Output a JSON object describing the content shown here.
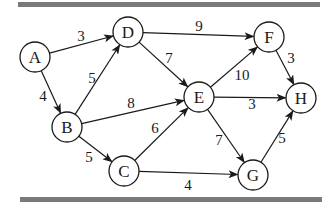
{
  "diagram": {
    "type": "weighted-directed-graph",
    "colors": {
      "bar": "#7a7a7a",
      "stroke": "#1a1a1a",
      "background": "#ffffff"
    },
    "bars": [
      {
        "name": "top-rule",
        "x": 18,
        "y": 2,
        "w": 302,
        "h": 5
      },
      {
        "name": "bottom-rule",
        "x": 20,
        "y": 197,
        "w": 302,
        "h": 5
      }
    ],
    "node_radius": 15,
    "nodes": [
      {
        "id": "A",
        "label": "A",
        "x": 35,
        "y": 57
      },
      {
        "id": "B",
        "label": "B",
        "x": 67,
        "y": 127
      },
      {
        "id": "C",
        "label": "C",
        "x": 124,
        "y": 171
      },
      {
        "id": "D",
        "label": "D",
        "x": 128,
        "y": 32
      },
      {
        "id": "E",
        "label": "E",
        "x": 199,
        "y": 97
      },
      {
        "id": "F",
        "label": "F",
        "x": 269,
        "y": 37
      },
      {
        "id": "G",
        "label": "G",
        "x": 253,
        "y": 175
      },
      {
        "id": "H",
        "label": "H",
        "x": 301,
        "y": 98
      }
    ],
    "edges": [
      {
        "from": "A",
        "to": "D",
        "weight": "3",
        "lx": 81,
        "ly": 36
      },
      {
        "from": "A",
        "to": "B",
        "weight": "4",
        "lx": 43,
        "ly": 96
      },
      {
        "from": "B",
        "to": "D",
        "weight": "5",
        "lx": 92,
        "ly": 78
      },
      {
        "from": "B",
        "to": "E",
        "weight": "8",
        "lx": 131,
        "ly": 103
      },
      {
        "from": "B",
        "to": "C",
        "weight": "5",
        "lx": 89,
        "ly": 157
      },
      {
        "from": "D",
        "to": "F",
        "weight": "9",
        "lx": 199,
        "ly": 26
      },
      {
        "from": "D",
        "to": "E",
        "weight": "7",
        "lx": 169,
        "ly": 58
      },
      {
        "from": "C",
        "to": "E",
        "weight": "6",
        "lx": 155,
        "ly": 128
      },
      {
        "from": "C",
        "to": "G",
        "weight": "4",
        "lx": 188,
        "ly": 185
      },
      {
        "from": "E",
        "to": "F",
        "weight": "10",
        "lx": 242,
        "ly": 75
      },
      {
        "from": "E",
        "to": "H",
        "weight": "3",
        "lx": 252,
        "ly": 104
      },
      {
        "from": "E",
        "to": "G",
        "weight": "7",
        "lx": 219,
        "ly": 140
      },
      {
        "from": "F",
        "to": "H",
        "weight": "3",
        "lx": 291,
        "ly": 58
      },
      {
        "from": "G",
        "to": "H",
        "weight": "5",
        "lx": 282,
        "ly": 138
      }
    ]
  }
}
